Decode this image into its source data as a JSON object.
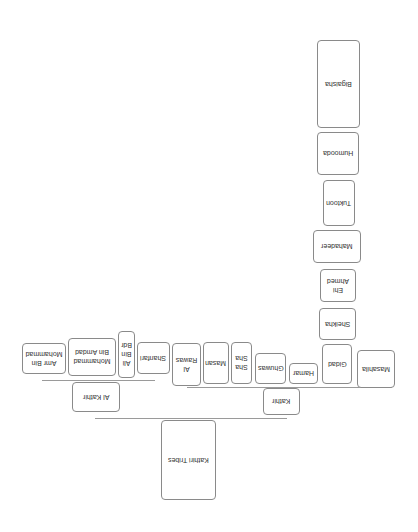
{
  "diagram": {
    "title": "Kathiri Tribes",
    "orientation": "rotated-180",
    "root": {
      "id": "root",
      "label": "Kathiri Tribes",
      "box": [
        161,
        420,
        55,
        80
      ]
    },
    "branches": [
      {
        "id": "al-kathir",
        "label": "Al Kathir",
        "box": [
          72,
          382,
          48,
          30
        ],
        "children": [
          {
            "label": "Amr Bin Mohammad",
            "box": [
              22,
              343,
              44,
              31
            ]
          },
          {
            "label": "Mohammad Bin Amdad",
            "box": [
              68,
              338,
              48,
              38
            ]
          },
          {
            "label": "Ali Bin Bdr",
            "box": [
              118,
              331,
              17,
              47
            ]
          },
          {
            "label": "Shanfari",
            "box": [
              137,
              342,
              33,
              32
            ]
          }
        ]
      },
      {
        "id": "kathir",
        "label": "Kathir",
        "box": [
          263,
          388,
          37,
          27
        ],
        "children": [
          {
            "label": "Al Rawas",
            "box": [
              172,
              343,
              29,
              43
            ]
          },
          {
            "label": "Masan",
            "box": [
              203,
              342,
              26,
              42
            ]
          },
          {
            "label": "Sha Sha",
            "box": [
              231,
              342,
              21,
              42
            ]
          },
          {
            "label": "Ghuwas",
            "box": [
              255,
              353,
              31,
              31
            ]
          },
          {
            "label": "Hamar",
            "box": [
              289,
              363,
              29,
              21
            ]
          },
          {
            "label": "Gidad",
            "box": [
              322,
              344,
              30,
              40
            ]
          },
          {
            "label": "Masahila",
            "box": [
              357,
              350,
              38,
              38
            ]
          }
        ]
      }
    ],
    "gidad_children": [
      {
        "label": "Sheikha",
        "box": [
          319,
          308,
          37,
          32
        ]
      },
      {
        "label": "Ehi Ahmed",
        "box": [
          320,
          269,
          36,
          33
        ]
      },
      {
        "label": "Mahadeer",
        "box": [
          313,
          230,
          48,
          33
        ]
      },
      {
        "label": "Tuktoon",
        "box": [
          323,
          180,
          32,
          46
        ]
      },
      {
        "label": "Humooda",
        "box": [
          317,
          132,
          42,
          43
        ]
      },
      {
        "label": "Bigaisha",
        "box": [
          317,
          40,
          43,
          88
        ]
      }
    ],
    "connectors": [
      {
        "name": "root-connector",
        "x1": 95,
        "x2": 287,
        "y": 418
      },
      {
        "name": "al-kathir-connector",
        "x1": 42,
        "x2": 155,
        "y": 380
      },
      {
        "name": "kathir-connector",
        "x1": 187,
        "x2": 392,
        "y": 387
      }
    ],
    "colors": {
      "border": "#8a8a8a",
      "line": "#9a9a9a",
      "text": "#333333",
      "background": "#ffffff"
    }
  }
}
